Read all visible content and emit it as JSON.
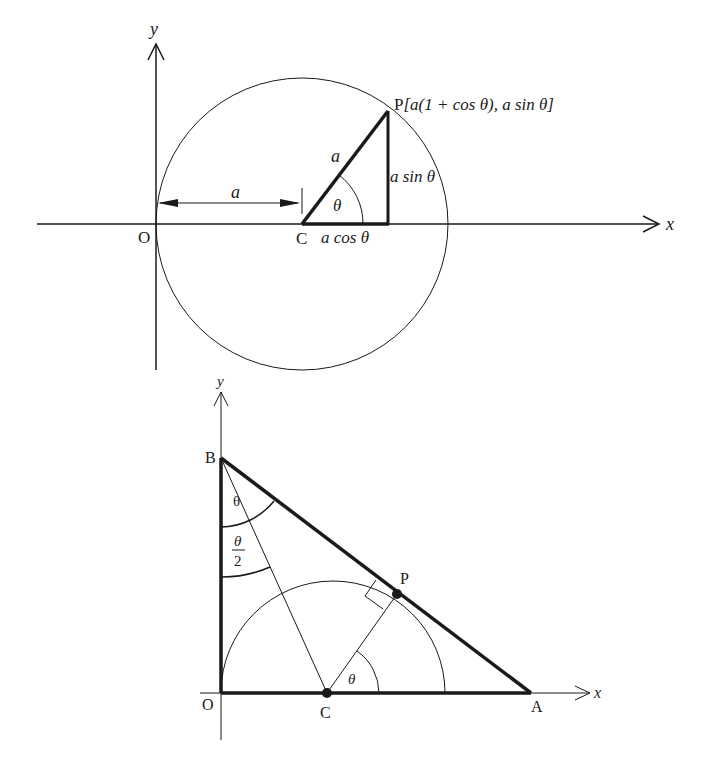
{
  "figure_top": {
    "axis_x_label": "x",
    "axis_y_label": "y",
    "origin_label": "O",
    "center_label": "C",
    "point_label": "P[a(1 + cos θ), a sin θ]",
    "point_label_P": "P",
    "point_label_coords": "[a(1 + cos θ), a sin θ]",
    "radius_label": "a",
    "dimension_label": "a",
    "angle_label": "θ",
    "adjacent_label": "a cos θ",
    "opposite_label": "a sin θ"
  },
  "figure_bottom": {
    "axis_x_label": "x",
    "axis_y_label": "y",
    "origin_label": "O",
    "vertex_b_label": "B",
    "vertex_a_label": "A",
    "center_label": "C",
    "tangent_point_label": "P",
    "angle_b_full_label": "θ",
    "angle_b_half_num": "θ",
    "angle_b_half_den": "2",
    "angle_c_label": "θ"
  },
  "colors": {
    "ink": "#1a1a1a",
    "background": "#ffffff"
  }
}
